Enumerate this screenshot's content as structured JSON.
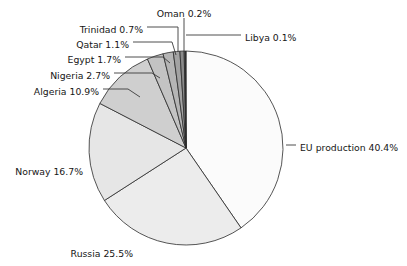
{
  "chart_data": {
    "type": "pie",
    "title": "",
    "subtitle": "",
    "xlabel": "",
    "ylabel": "",
    "legend_position": "none",
    "grid": false,
    "units": "percent",
    "total": 100.0,
    "start_angle_deg": 0,
    "direction": "clockwise",
    "categories": [
      "EU production",
      "Russia",
      "Norway",
      "Algeria",
      "Nigeria",
      "Egypt",
      "Qatar",
      "Trinidad",
      "Oman",
      "Libya"
    ],
    "values": [
      40.4,
      25.5,
      16.7,
      10.9,
      2.7,
      1.7,
      1.1,
      0.7,
      0.2,
      0.1
    ],
    "slices": [
      {
        "name": "EU production",
        "value": 40.4,
        "label": "EU production 40.4%",
        "color": "#fbfbfb",
        "label_x": 300,
        "label_y": 148,
        "label_anchor": "start",
        "leader": "M 286 145 L 296 145"
      },
      {
        "name": "Russia",
        "value": 25.5,
        "label": "Russia 25.5%",
        "color": "#ececec",
        "label_x": 133,
        "label_y": 254,
        "label_anchor": "end",
        "leader": ""
      },
      {
        "name": "Norway",
        "value": 16.7,
        "label": "Norway 16.7%",
        "color": "#e6e6e6",
        "label_x": 83,
        "label_y": 172,
        "label_anchor": "end",
        "leader": ""
      },
      {
        "name": "Algeria",
        "value": 10.9,
        "label": "Algeria 10.9%",
        "color": "#cfcfcf",
        "label_x": 99,
        "label_y": 92,
        "label_anchor": "end",
        "leader": "M 103 89 L 128 89 L 140 97"
      },
      {
        "name": "Nigeria",
        "value": 2.7,
        "label": "Nigeria 2.7%",
        "color": "#c3c3c3",
        "label_x": 110,
        "label_y": 76,
        "label_anchor": "end",
        "leader": "M 114 73 L 152 73 L 160 78"
      },
      {
        "name": "Egypt",
        "value": 1.7,
        "label": "Egypt 1.7%",
        "color": "#b5b5b5",
        "label_x": 121,
        "label_y": 60,
        "label_anchor": "end",
        "leader": "M 125 57 L 163 57 L 170 63"
      },
      {
        "name": "Qatar",
        "value": 1.1,
        "label": "Qatar 1.1%",
        "color": "#a3a3a3",
        "label_x": 129,
        "label_y": 45,
        "label_anchor": "end",
        "leader": "M 133 42 L 172 42 L 176 55"
      },
      {
        "name": "Trinidad",
        "value": 0.7,
        "label": "Trinidad 0.7%",
        "color": "#8a8a8a",
        "label_x": 143,
        "label_y": 30,
        "label_anchor": "end",
        "leader": "M 147 27 L 178 27 L 178 52"
      },
      {
        "name": "Oman",
        "value": 0.2,
        "label": "Oman 0.2%",
        "color": "#6b6b6b",
        "label_x": 184,
        "label_y": 14,
        "label_anchor": "middle",
        "leader": "M 184 18 L 184 51"
      },
      {
        "name": "Libya",
        "value": 0.1,
        "label": "Libya 0.1%",
        "color": "#3b3b3b",
        "label_x": 245,
        "label_y": 38,
        "label_anchor": "start",
        "leader": "M 186 35 L 241 35"
      }
    ],
    "geometry": {
      "center_x": 186,
      "center_y": 148,
      "radius": 97
    }
  }
}
